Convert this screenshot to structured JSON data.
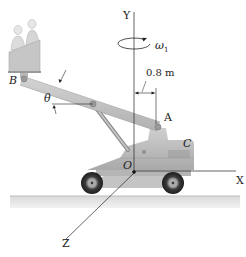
{
  "diagram": {
    "type": "mechanics-figure",
    "labels": {
      "y_axis": "Y",
      "x_axis": "X",
      "z_axis": "Z",
      "origin": "O",
      "point_a": "A",
      "point_b": "B",
      "point_c": "C",
      "angle": "θ",
      "omega": "ω",
      "omega_sub": "1",
      "dimension": "0.8 m"
    },
    "colors": {
      "line": "#222222",
      "body": "#bdbdbd",
      "body_dark": "#9a9a9a",
      "ground": "#d6d6d6",
      "tire": "#3a3a3a"
    }
  }
}
